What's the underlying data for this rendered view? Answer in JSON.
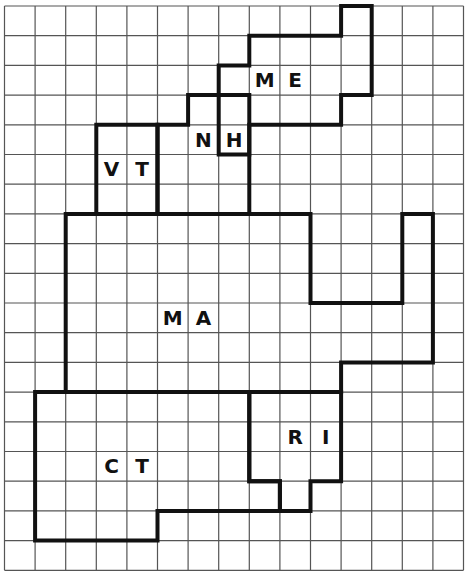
{
  "grid": {
    "columns": 15,
    "rows": 19,
    "origin_x": 4.5,
    "origin_y": 6,
    "cell_w": 30.6,
    "cell_h": 29.7,
    "line_color": "#555555",
    "border_color": "#111111"
  },
  "states": [
    {
      "name": "ME",
      "letters": [
        "M",
        "E"
      ],
      "label_cells": [
        [
          8.5,
          2.5
        ],
        [
          9.5,
          2.5
        ]
      ],
      "outline": [
        [
          11,
          0
        ],
        [
          12,
          0
        ],
        [
          12,
          3
        ],
        [
          11,
          3
        ],
        [
          11,
          4
        ],
        [
          8,
          4
        ],
        [
          8,
          5
        ],
        [
          7,
          5
        ],
        [
          7,
          2
        ],
        [
          8,
          2
        ],
        [
          8,
          1
        ],
        [
          11,
          1
        ]
      ]
    },
    {
      "name": "NH",
      "letters": [
        "N",
        "H"
      ],
      "label_cells": [
        [
          6.5,
          4.5
        ],
        [
          7.5,
          4.5
        ]
      ],
      "outline": [
        [
          6,
          3
        ],
        [
          8,
          3
        ],
        [
          8,
          7
        ],
        [
          5,
          7
        ],
        [
          5,
          4
        ],
        [
          6,
          4
        ]
      ]
    },
    {
      "name": "VT",
      "letters": [
        "V",
        "T"
      ],
      "label_cells": [
        [
          3.5,
          5.5
        ],
        [
          4.5,
          5.5
        ]
      ],
      "outline": [
        [
          3,
          4
        ],
        [
          5,
          4
        ],
        [
          5,
          7
        ],
        [
          3,
          7
        ]
      ]
    },
    {
      "name": "MA",
      "letters": [
        "M",
        "A"
      ],
      "label_cells": [
        [
          5.5,
          10.5
        ],
        [
          6.5,
          10.5
        ]
      ],
      "outline": [
        [
          2,
          7
        ],
        [
          10,
          7
        ],
        [
          10,
          10
        ],
        [
          13,
          10
        ],
        [
          13,
          7
        ],
        [
          14,
          7
        ],
        [
          14,
          12
        ],
        [
          11,
          12
        ],
        [
          11,
          13
        ],
        [
          2,
          13
        ]
      ]
    },
    {
      "name": "RI",
      "letters": [
        "R",
        "I"
      ],
      "label_cells": [
        [
          9.5,
          14.5
        ],
        [
          10.5,
          14.5
        ]
      ],
      "outline": [
        [
          8,
          13
        ],
        [
          11,
          13
        ],
        [
          11,
          16
        ],
        [
          10,
          16
        ],
        [
          10,
          17
        ],
        [
          9,
          17
        ],
        [
          9,
          16
        ],
        [
          8,
          16
        ]
      ]
    },
    {
      "name": "CT",
      "letters": [
        "C",
        "T"
      ],
      "label_cells": [
        [
          3.5,
          15.5
        ],
        [
          4.5,
          15.5
        ]
      ],
      "outline": [
        [
          1,
          13
        ],
        [
          8,
          13
        ],
        [
          8,
          16
        ],
        [
          9,
          16
        ],
        [
          9,
          17
        ],
        [
          5,
          17
        ],
        [
          5,
          18
        ],
        [
          1,
          18
        ]
      ]
    }
  ]
}
